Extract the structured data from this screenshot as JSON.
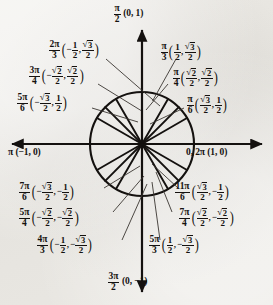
{
  "figure": {
    "type": "unit-circle-diagram",
    "colors": {
      "ink": "#14110f",
      "paper": "#e8e6e1"
    }
  },
  "axes": {
    "x_positive_label": "0, 2π (1, 0)",
    "x_negative_label": "π (−1, 0)",
    "y_positive": {
      "angle": "π/2",
      "point": "(0, 1)"
    },
    "y_negative": {
      "angle": "3π/2",
      "point": "(0, −1)"
    }
  },
  "chart_data": {
    "type": "scatter",
    "xlabel": "x",
    "ylabel": "y",
    "xlim": [
      -1,
      1
    ],
    "ylim": [
      -1,
      1
    ],
    "grid": false,
    "legend": "none",
    "points": [
      {
        "angle_deg": 0,
        "angle_label": "0, 2π",
        "x": 1,
        "y": 0,
        "x_label": "1",
        "y_label": "0"
      },
      {
        "angle_deg": 30,
        "angle_label": "π/6",
        "x": 0.866,
        "y": 0.5,
        "x_label": "√3/2",
        "y_label": "1/2"
      },
      {
        "angle_deg": 45,
        "angle_label": "π/4",
        "x": 0.7071,
        "y": 0.7071,
        "x_label": "√2/2",
        "y_label": "√2/2"
      },
      {
        "angle_deg": 60,
        "angle_label": "π/3",
        "x": 0.5,
        "y": 0.866,
        "x_label": "1/2",
        "y_label": "√3/2"
      },
      {
        "angle_deg": 90,
        "angle_label": "π/2",
        "x": 0,
        "y": 1,
        "x_label": "0",
        "y_label": "1"
      },
      {
        "angle_deg": 120,
        "angle_label": "2π/3",
        "x": -0.5,
        "y": 0.866,
        "x_label": "−1/2",
        "y_label": "√3/2"
      },
      {
        "angle_deg": 135,
        "angle_label": "3π/4",
        "x": -0.7071,
        "y": 0.7071,
        "x_label": "−√2/2",
        "y_label": "√2/2"
      },
      {
        "angle_deg": 150,
        "angle_label": "5π/6",
        "x": -0.866,
        "y": 0.5,
        "x_label": "−√3/2",
        "y_label": "1/2"
      },
      {
        "angle_deg": 180,
        "angle_label": "π",
        "x": -1,
        "y": 0,
        "x_label": "−1",
        "y_label": "0"
      },
      {
        "angle_deg": 210,
        "angle_label": "7π/6",
        "x": -0.866,
        "y": -0.5,
        "x_label": "−√3/2",
        "y_label": "−1/2"
      },
      {
        "angle_deg": 225,
        "angle_label": "5π/4",
        "x": -0.7071,
        "y": -0.7071,
        "x_label": "−√2/2",
        "y_label": "−√2/2"
      },
      {
        "angle_deg": 240,
        "angle_label": "4π/3",
        "x": -0.5,
        "y": -0.866,
        "x_label": "−1/2",
        "y_label": "−√3/2"
      },
      {
        "angle_deg": 270,
        "angle_label": "3π/2",
        "x": 0,
        "y": -1,
        "x_label": "0",
        "y_label": "−1"
      },
      {
        "angle_deg": 300,
        "angle_label": "5π/3",
        "x": 0.5,
        "y": -0.866,
        "x_label": "1/2",
        "y_label": "−√3/2"
      },
      {
        "angle_deg": 315,
        "angle_label": "7π/4",
        "x": 0.7071,
        "y": -0.7071,
        "x_label": "√2/2",
        "y_label": "−√2/2"
      },
      {
        "angle_deg": 330,
        "angle_label": "11π/6",
        "x": 0.866,
        "y": -0.5,
        "x_label": "√3/2",
        "y_label": "−1/2"
      }
    ]
  },
  "labels": {
    "top": {
      "num": "π",
      "den": "2",
      "coords": "(0, 1)"
    },
    "bottom": {
      "num": "3π",
      "den": "2",
      "coords": "(0, −1)"
    },
    "left": {
      "text": "π (−1, 0)"
    },
    "right": {
      "text": "0, 2π (1, 0)"
    },
    "q1": [
      {
        "num": "π",
        "den": "3",
        "xn": "1",
        "xd": "2",
        "xrad": "",
        "yn": "3",
        "yd": "2",
        "yrad": "sqrt",
        "xneg": "",
        "yneg": ""
      },
      {
        "num": "π",
        "den": "4",
        "xn": "2",
        "xd": "2",
        "xrad": "sqrt",
        "yn": "2",
        "yd": "2",
        "yrad": "sqrt",
        "xneg": "",
        "yneg": ""
      },
      {
        "num": "π",
        "den": "6",
        "xn": "3",
        "xd": "2",
        "xrad": "sqrt",
        "yn": "1",
        "yd": "2",
        "yrad": "",
        "xneg": "",
        "yneg": ""
      }
    ],
    "q2": [
      {
        "num": "2π",
        "den": "3",
        "xn": "1",
        "xd": "2",
        "xrad": "",
        "yn": "3",
        "yd": "2",
        "yrad": "sqrt",
        "xneg": "−",
        "yneg": ""
      },
      {
        "num": "3π",
        "den": "4",
        "xn": "2",
        "xd": "2",
        "xrad": "sqrt",
        "yn": "2",
        "yd": "2",
        "yrad": "sqrt",
        "xneg": "−",
        "yneg": ""
      },
      {
        "num": "5π",
        "den": "6",
        "xn": "3",
        "xd": "2",
        "xrad": "sqrt",
        "yn": "1",
        "yd": "2",
        "yrad": "",
        "xneg": "−",
        "yneg": ""
      }
    ],
    "q3": [
      {
        "num": "7π",
        "den": "6",
        "xn": "3",
        "xd": "2",
        "xrad": "sqrt",
        "yn": "1",
        "yd": "2",
        "yrad": "",
        "xneg": "−",
        "yneg": "−"
      },
      {
        "num": "5π",
        "den": "4",
        "xn": "2",
        "xd": "2",
        "xrad": "sqrt",
        "yn": "2",
        "yd": "2",
        "yrad": "sqrt",
        "xneg": "−",
        "yneg": "−"
      },
      {
        "num": "4π",
        "den": "3",
        "xn": "1",
        "xd": "2",
        "xrad": "",
        "yn": "3",
        "yd": "2",
        "yrad": "sqrt",
        "xneg": "−",
        "yneg": "−"
      }
    ],
    "q4": [
      {
        "num": "11π",
        "den": "6",
        "xn": "3",
        "xd": "2",
        "xrad": "sqrt",
        "yn": "1",
        "yd": "2",
        "yrad": "",
        "xneg": "",
        "yneg": "−"
      },
      {
        "num": "7π",
        "den": "4",
        "xn": "2",
        "xd": "2",
        "xrad": "sqrt",
        "yn": "2",
        "yd": "2",
        "yrad": "sqrt",
        "xneg": "",
        "yneg": "−"
      },
      {
        "num": "5π",
        "den": "3",
        "xn": "1",
        "xd": "2",
        "xrad": "",
        "yn": "3",
        "yd": "2",
        "yrad": "sqrt",
        "xneg": "",
        "yneg": "−"
      }
    ]
  }
}
